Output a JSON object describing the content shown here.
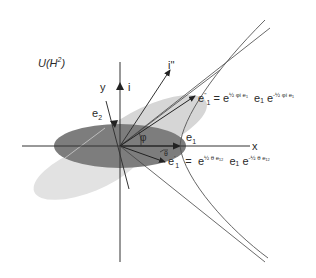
{
  "title_parts": {
    "base": "U(H",
    "sup": "2",
    "close": ")"
  },
  "axes": {
    "x": "x",
    "y": "y",
    "i": "i",
    "i_double_prime": "i''"
  },
  "vectors": {
    "e1": "e",
    "e1_sub": "1",
    "e2": "e",
    "e2_sub": "2",
    "e1_prime": "e",
    "e1_prime_sub": "1",
    "e1_prime_mark": "'",
    "e1_dprime": "e",
    "e1_dprime_sub": "1",
    "e1_dprime_mark": "''"
  },
  "angles": {
    "phi": "φ",
    "theta": "θ"
  },
  "equations": {
    "e1_dprime": {
      "lhs": "e''₁",
      "eq": "=",
      "e": "e",
      "exp1": "½ φi e₁",
      "mid": "e₁",
      "e2": "e",
      "exp2": "-½ φi e₁"
    },
    "e1_prime": {
      "lhs": "e'₁",
      "eq": "=",
      "e": "e",
      "exp1": "½ θ e₁₂",
      "mid": "e₁",
      "e2": "e",
      "exp2": "-½ θ e₁₂"
    }
  },
  "colors": {
    "dark_ellipse": "#7a7a7a",
    "light_ellipse": "#dcdcdc",
    "mid_ellipse": "#cfcfcf",
    "line": "#333333",
    "hyperbola": "#555555"
  }
}
